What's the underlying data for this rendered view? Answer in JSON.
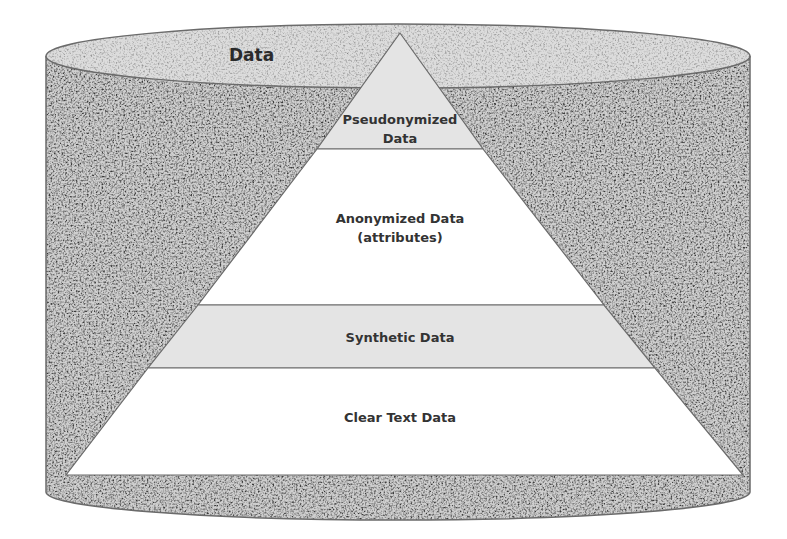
{
  "diagram": {
    "container_label": "Data",
    "container_shape": "cylinder",
    "pyramid_layers": [
      {
        "label": "Pseudonymized Data",
        "line1": "Pseudonymized",
        "line2": "Data",
        "fill": "#e4e4e4",
        "position": "top"
      },
      {
        "label": "Anonymized Data (attributes)",
        "line1": "Anonymized Data",
        "line2": "(attributes)",
        "fill": "#ffffff",
        "position": "second"
      },
      {
        "label": "Synthetic Data",
        "line1": "Synthetic Data",
        "fill": "#e4e4e4",
        "position": "third"
      },
      {
        "label": "Clear Text Data",
        "line1": "Clear Text Data",
        "fill": "#ffffff",
        "position": "bottom"
      }
    ],
    "colors": {
      "texture_base": "#c8c8c8",
      "outline": "#6b6b6b",
      "text": "#333333"
    }
  }
}
